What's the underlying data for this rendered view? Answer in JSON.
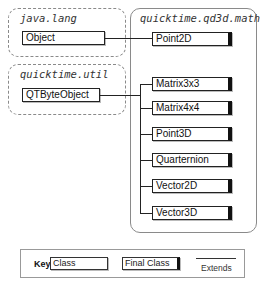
{
  "diagram": {
    "packages": [
      {
        "name": "java.lang",
        "classes": [
          "Object"
        ]
      },
      {
        "name": "quicktime.util",
        "classes": [
          "QTByteObject"
        ]
      },
      {
        "name": "quicktime.qd3d.math",
        "classes": [
          "Point2D",
          "Matrix3x3",
          "Matrix4x4",
          "Point3D",
          "Quarternion",
          "Vector2D",
          "Vector3D"
        ]
      }
    ],
    "labels": {
      "java_lang": "java.lang",
      "quicktime_util": "quicktime.util",
      "qd3d_math": "quicktime.qd3d.math"
    },
    "classes": {
      "object": "Object",
      "qtbyteobject": "QTByteObject",
      "point2d": "Point2D",
      "matrix3x3": "Matrix3x3",
      "matrix4x4": "Matrix4x4",
      "point3d": "Point3D",
      "quarternion": "Quarternion",
      "vector2d": "Vector2D",
      "vector3d": "Vector3D"
    },
    "edges": [
      {
        "from": "Point2D",
        "to": "Object",
        "type": "extends"
      },
      {
        "from": "Matrix3x3",
        "to": "QTByteObject",
        "type": "extends"
      },
      {
        "from": "Matrix4x4",
        "to": "QTByteObject",
        "type": "extends"
      },
      {
        "from": "Point3D",
        "to": "QTByteObject",
        "type": "extends"
      },
      {
        "from": "Quarternion",
        "to": "QTByteObject",
        "type": "extends"
      },
      {
        "from": "Vector2D",
        "to": "QTByteObject",
        "type": "extends"
      },
      {
        "from": "Vector3D",
        "to": "QTByteObject",
        "type": "extends"
      }
    ]
  },
  "key": {
    "title": "Key",
    "class_label": "Class",
    "final_class_label": "Final Class",
    "extends_label": "Extends"
  }
}
